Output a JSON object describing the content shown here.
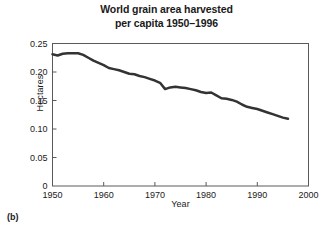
{
  "figure": {
    "panel_caption": "(b)"
  },
  "chart_data": {
    "type": "line",
    "title": "World grain area harvested per capita 1950–1996",
    "title_line1": "World grain area harvested",
    "title_line2": "per capita 1950–1996",
    "xlabel": "Year",
    "ylabel": "Hectares",
    "xlim": [
      1950,
      2000
    ],
    "ylim": [
      0,
      0.25
    ],
    "xticks": [
      1950,
      1960,
      1970,
      1980,
      1990,
      2000
    ],
    "xtick_labels": [
      "1950",
      "1960",
      "1970",
      "1980",
      "1990",
      "2000"
    ],
    "yticks": [
      0,
      0.05,
      0.1,
      0.15,
      0.2,
      0.25
    ],
    "ytick_labels": [
      "0",
      "0.05",
      "0.10",
      "0.15",
      "0.20",
      "0.25"
    ],
    "grid": false,
    "legend": false,
    "line_color": "#333333",
    "line_width": 2.5,
    "markers": false,
    "series": [
      {
        "name": "Grain area harvested per capita",
        "x": [
          1950,
          1951,
          1952,
          1953,
          1954,
          1955,
          1956,
          1957,
          1958,
          1959,
          1960,
          1961,
          1962,
          1963,
          1964,
          1965,
          1966,
          1967,
          1968,
          1969,
          1970,
          1971,
          1972,
          1973,
          1974,
          1975,
          1976,
          1977,
          1978,
          1979,
          1980,
          1981,
          1982,
          1983,
          1984,
          1985,
          1986,
          1987,
          1988,
          1989,
          1990,
          1991,
          1992,
          1993,
          1994,
          1995,
          1996
        ],
        "values": [
          0.231,
          0.229,
          0.232,
          0.233,
          0.233,
          0.233,
          0.23,
          0.225,
          0.22,
          0.216,
          0.212,
          0.207,
          0.205,
          0.203,
          0.2,
          0.197,
          0.196,
          0.193,
          0.191,
          0.188,
          0.185,
          0.181,
          0.17,
          0.173,
          0.174,
          0.173,
          0.172,
          0.17,
          0.168,
          0.165,
          0.163,
          0.164,
          0.159,
          0.154,
          0.153,
          0.151,
          0.148,
          0.143,
          0.139,
          0.137,
          0.135,
          0.132,
          0.129,
          0.126,
          0.123,
          0.12,
          0.118
        ]
      }
    ],
    "annotations": []
  }
}
